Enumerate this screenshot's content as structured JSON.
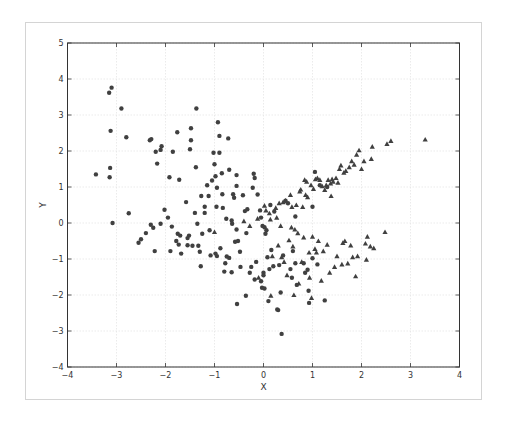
{
  "chart_data": {
    "type": "scatter",
    "title": "",
    "xlabel": "X",
    "ylabel": "Y",
    "xlim": [
      -4,
      4
    ],
    "ylim": [
      -4,
      5
    ],
    "xticks": [
      -4,
      -3,
      -2,
      -1,
      0,
      1,
      2,
      3,
      4
    ],
    "yticks": [
      -4,
      -3,
      -2,
      -1,
      0,
      1,
      2,
      3,
      4,
      5
    ],
    "grid": true,
    "legend": null,
    "marker_color": "#404040",
    "series": [
      {
        "name": "circles",
        "marker": "circle",
        "points": [
          [
            -3.42,
            1.35
          ],
          [
            -3.15,
            3.62
          ],
          [
            -3.1,
            3.76
          ],
          [
            -3.12,
            2.56
          ],
          [
            -3.13,
            1.53
          ],
          [
            -3.14,
            1.27
          ],
          [
            -3.08,
            0.0
          ],
          [
            -2.9,
            3.18
          ],
          [
            -2.8,
            2.38
          ],
          [
            -2.75,
            0.27
          ],
          [
            -2.55,
            -0.55
          ],
          [
            -2.5,
            -0.45
          ],
          [
            -2.4,
            -0.28
          ],
          [
            -2.32,
            2.3
          ],
          [
            -2.29,
            2.33
          ],
          [
            -2.3,
            -0.05
          ],
          [
            -2.25,
            -0.13
          ],
          [
            -2.22,
            -0.78
          ],
          [
            -2.2,
            1.98
          ],
          [
            -2.17,
            1.65
          ],
          [
            -2.1,
            2.03
          ],
          [
            -2.08,
            2.13
          ],
          [
            -2.1,
            -0.02
          ],
          [
            -2.02,
            0.37
          ],
          [
            -1.95,
            0.15
          ],
          [
            -1.92,
            1.27
          ],
          [
            -1.9,
            -0.78
          ],
          [
            -1.87,
            -0.1
          ],
          [
            -1.85,
            1.98
          ],
          [
            -1.78,
            -0.5
          ],
          [
            -1.76,
            2.52
          ],
          [
            -1.75,
            -0.3
          ],
          [
            -1.73,
            -0.6
          ],
          [
            -1.72,
            1.2
          ],
          [
            -1.7,
            -0.35
          ],
          [
            -1.68,
            -0.85
          ],
          [
            -1.58,
            0.58
          ],
          [
            -1.55,
            -0.62
          ],
          [
            -1.55,
            -0.42
          ],
          [
            -1.52,
            -0.35
          ],
          [
            -1.5,
            2.05
          ],
          [
            -1.48,
            2.63
          ],
          [
            -1.48,
            2.3
          ],
          [
            -1.45,
            -0.63
          ],
          [
            -1.4,
            0.28
          ],
          [
            -1.38,
            1.55
          ],
          [
            -1.37,
            3.18
          ],
          [
            -1.35,
            -0.02
          ],
          [
            -1.33,
            -0.63
          ],
          [
            -1.3,
            -0.8
          ],
          [
            -1.28,
            -1.2
          ],
          [
            -1.27,
            0.75
          ],
          [
            -1.25,
            -0.3
          ],
          [
            -1.2,
            0.45
          ],
          [
            -1.2,
            0.28
          ],
          [
            -1.15,
            1.05
          ],
          [
            -1.12,
            0.75
          ],
          [
            -1.1,
            -0.2
          ],
          [
            -1.08,
            -0.9
          ],
          [
            -1.05,
            1.18
          ],
          [
            -1.02,
            1.95
          ],
          [
            -1.0,
            1.63
          ],
          [
            -0.98,
            1.3
          ],
          [
            -0.98,
            -0.85
          ],
          [
            -0.96,
            0.45
          ],
          [
            -0.95,
            0.98
          ],
          [
            -0.95,
            -0.92
          ],
          [
            -0.93,
            2.8
          ],
          [
            -0.9,
            2.42
          ],
          [
            -0.9,
            1.95
          ],
          [
            -0.88,
            -0.7
          ],
          [
            -0.85,
            1.38
          ],
          [
            -0.84,
            0.8
          ],
          [
            -0.83,
            0.42
          ],
          [
            -0.8,
            -1.35
          ],
          [
            -0.78,
            -1.12
          ],
          [
            -0.76,
            0.12
          ],
          [
            -0.75,
            -0.93
          ],
          [
            -0.72,
            2.35
          ],
          [
            -0.7,
            1.48
          ],
          [
            -0.7,
            -0.97
          ],
          [
            -0.65,
            0.07
          ],
          [
            -0.65,
            -1.37
          ],
          [
            -0.64,
            -0.02
          ],
          [
            -0.62,
            0.8
          ],
          [
            -0.6,
            0.7
          ],
          [
            -0.58,
            -0.52
          ],
          [
            -0.55,
            1.33
          ],
          [
            -0.55,
            1.03
          ],
          [
            -0.55,
            -0.18
          ],
          [
            -0.54,
            -2.25
          ],
          [
            -0.52,
            -0.5
          ],
          [
            -0.48,
            -0.8
          ],
          [
            -0.47,
            -1.22
          ],
          [
            -0.42,
            0.77
          ],
          [
            -0.38,
            0.33
          ],
          [
            -0.36,
            -2.02
          ],
          [
            -0.35,
            -0.28
          ],
          [
            -0.33,
            0.38
          ],
          [
            -0.28,
            -1.38
          ],
          [
            -0.25,
            -1.22
          ],
          [
            -0.22,
            0.98
          ],
          [
            -0.2,
            1.37
          ],
          [
            -0.18,
            1.25
          ],
          [
            -0.18,
            -1.57
          ],
          [
            -0.15,
            -1.08
          ],
          [
            -0.12,
            0.79
          ],
          [
            -0.07,
            0.35
          ],
          [
            -0.05,
            0.15
          ],
          [
            -0.05,
            -1.62
          ],
          [
            -0.03,
            -1.8
          ],
          [
            -0.02,
            -0.08
          ],
          [
            0.0,
            -1.38
          ],
          [
            0.0,
            -1.45
          ],
          [
            0.02,
            -1.82
          ],
          [
            0.02,
            -0.12
          ],
          [
            0.04,
            -0.3
          ],
          [
            0.06,
            -0.2
          ],
          [
            0.08,
            -0.95
          ],
          [
            0.1,
            -2.17
          ],
          [
            0.12,
            -1.28
          ],
          [
            0.14,
            0.5
          ],
          [
            0.16,
            -0.75
          ],
          [
            0.2,
            -1.2
          ],
          [
            0.22,
            0.32
          ],
          [
            0.28,
            -2.4
          ],
          [
            0.3,
            -2.42
          ],
          [
            0.32,
            -1.17
          ],
          [
            0.35,
            -1.93
          ],
          [
            0.37,
            -3.08
          ],
          [
            0.4,
            -0.9
          ],
          [
            0.45,
            0.62
          ],
          [
            0.5,
            0.55
          ],
          [
            0.55,
            -1.28
          ],
          [
            0.58,
            -1.52
          ],
          [
            0.6,
            -0.78
          ],
          [
            0.65,
            0.18
          ],
          [
            0.65,
            -1.12
          ],
          [
            0.68,
            -1.72
          ],
          [
            0.82,
            -1.12
          ],
          [
            0.85,
            -1.38
          ],
          [
            0.9,
            -1.3
          ],
          [
            0.92,
            -1.88
          ],
          [
            0.93,
            -2.22
          ],
          [
            1.0,
            -0.98
          ],
          [
            1.0,
            0.45
          ],
          [
            1.05,
            1.42
          ],
          [
            1.1,
            -1.15
          ],
          [
            1.15,
            1.05
          ],
          [
            1.25,
            -2.15
          ],
          [
            1.3,
            1.0
          ]
        ]
      },
      {
        "name": "triangles",
        "marker": "triangle",
        "points": [
          [
            -1.0,
            -0.25
          ],
          [
            -0.4,
            0.05
          ],
          [
            -0.28,
            -0.08
          ],
          [
            -0.12,
            0.12
          ],
          [
            -0.1,
            -1.52
          ],
          [
            0.02,
            0.48
          ],
          [
            0.05,
            0.35
          ],
          [
            0.12,
            0.27
          ],
          [
            0.14,
            0.1
          ],
          [
            0.15,
            -2.02
          ],
          [
            0.18,
            -0.92
          ],
          [
            0.25,
            0.42
          ],
          [
            0.27,
            0.15
          ],
          [
            0.3,
            -0.62
          ],
          [
            0.32,
            0.55
          ],
          [
            0.35,
            -0.08
          ],
          [
            0.37,
            -0.95
          ],
          [
            0.4,
            0.58
          ],
          [
            0.42,
            -1.08
          ],
          [
            0.45,
            0.62
          ],
          [
            0.48,
            -1.45
          ],
          [
            0.52,
            -0.48
          ],
          [
            0.55,
            0.78
          ],
          [
            0.57,
            -0.12
          ],
          [
            0.58,
            0.45
          ],
          [
            0.6,
            -0.65
          ],
          [
            0.62,
            -2.0
          ],
          [
            0.64,
            -0.18
          ],
          [
            0.67,
            0.5
          ],
          [
            0.7,
            -0.28
          ],
          [
            0.72,
            -1.68
          ],
          [
            0.74,
            0.88
          ],
          [
            0.76,
            0.93
          ],
          [
            0.78,
            -1.08
          ],
          [
            0.8,
            0.45
          ],
          [
            0.82,
            -0.4
          ],
          [
            0.84,
            1.2
          ],
          [
            0.86,
            0.78
          ],
          [
            0.88,
            1.15
          ],
          [
            0.9,
            0.72
          ],
          [
            0.93,
            -0.82
          ],
          [
            0.94,
            -1.52
          ],
          [
            0.97,
            1.05
          ],
          [
            0.98,
            -2.08
          ],
          [
            1.0,
            -0.38
          ],
          [
            1.02,
            0.95
          ],
          [
            1.05,
            -0.72
          ],
          [
            1.06,
            1.22
          ],
          [
            1.08,
            -0.82
          ],
          [
            1.1,
            1.25
          ],
          [
            1.12,
            -0.5
          ],
          [
            1.15,
            1.2
          ],
          [
            1.18,
            -1.6
          ],
          [
            1.2,
            1.02
          ],
          [
            1.22,
            -0.78
          ],
          [
            1.25,
            0.92
          ],
          [
            1.28,
            1.05
          ],
          [
            1.3,
            -0.6
          ],
          [
            1.32,
            1.2
          ],
          [
            1.35,
            -1.38
          ],
          [
            1.37,
            1.1
          ],
          [
            1.38,
            0.75
          ],
          [
            1.4,
            1.22
          ],
          [
            1.42,
            1.15
          ],
          [
            1.45,
            -1.22
          ],
          [
            1.48,
            1.25
          ],
          [
            1.5,
            -0.92
          ],
          [
            1.52,
            1.12
          ],
          [
            1.55,
            1.5
          ],
          [
            1.58,
            1.6
          ],
          [
            1.6,
            -1.15
          ],
          [
            1.62,
            -0.55
          ],
          [
            1.64,
            1.4
          ],
          [
            1.66,
            -0.5
          ],
          [
            1.68,
            1.45
          ],
          [
            1.72,
            -1.12
          ],
          [
            1.75,
            1.55
          ],
          [
            1.78,
            -0.62
          ],
          [
            1.8,
            1.72
          ],
          [
            1.82,
            -0.95
          ],
          [
            1.85,
            1.62
          ],
          [
            1.88,
            -1.48
          ],
          [
            1.9,
            1.9
          ],
          [
            1.92,
            -0.92
          ],
          [
            1.95,
            2.02
          ],
          [
            2.0,
            1.5
          ],
          [
            2.05,
            1.72
          ],
          [
            2.08,
            -0.57
          ],
          [
            2.1,
            -1.02
          ],
          [
            2.12,
            -0.38
          ],
          [
            2.18,
            -0.65
          ],
          [
            2.2,
            1.78
          ],
          [
            2.22,
            2.12
          ],
          [
            2.25,
            -0.7
          ],
          [
            2.48,
            -0.25
          ],
          [
            2.52,
            2.2
          ],
          [
            2.6,
            2.28
          ],
          [
            3.3,
            2.32
          ]
        ]
      }
    ]
  }
}
